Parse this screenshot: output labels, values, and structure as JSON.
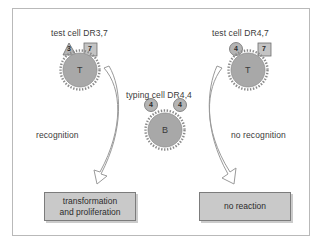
{
  "figure": {
    "background_color": "#ffffff",
    "frame_color": "#b9b9b9"
  },
  "cells": [
    {
      "id": "test-cell-left",
      "caption": "test cell DR3,7",
      "letter": "T",
      "markers": [
        {
          "shape": "triangle",
          "value": "3"
        },
        {
          "shape": "square",
          "value": "7"
        }
      ]
    },
    {
      "id": "typing-cell",
      "caption": "typing cell DR4,4",
      "letter": "B",
      "markers": [
        {
          "shape": "circle",
          "value": "4"
        },
        {
          "shape": "circle",
          "value": "4"
        }
      ]
    },
    {
      "id": "test-cell-right",
      "caption": "test cell DR4,7",
      "letter": "T",
      "markers": [
        {
          "shape": "circle",
          "value": "4"
        },
        {
          "shape": "square",
          "value": "7"
        }
      ]
    }
  ],
  "pathways": [
    {
      "id": "left-pathway",
      "label": "recognition",
      "outcome": "transformation\nand proliferation",
      "outcome_line1": "transformation",
      "outcome_line2": "and proliferation"
    },
    {
      "id": "right-pathway",
      "label": "no recognition",
      "outcome": "no reaction",
      "outcome_line1": "no reaction",
      "outcome_line2": ""
    }
  ],
  "colors": {
    "cell_fill": "#a8a8a8",
    "cell_ring": "#8f8f8f",
    "marker_fill": "#b4b4b4",
    "box_fill": "#c9c9c9",
    "box_border": "#7c7c7c",
    "arrow_fill": "#ffffff",
    "arrow_stroke": "#9a9a9a",
    "text": "#3a3a3a"
  }
}
